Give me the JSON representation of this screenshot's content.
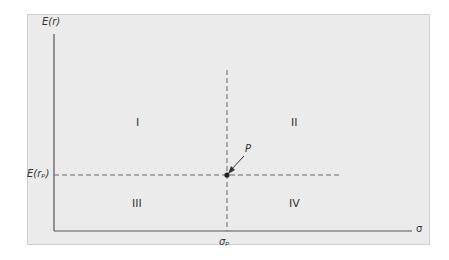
{
  "diagram": {
    "y_axis_label": "E(r)",
    "x_axis_label": "σ",
    "point_label": "P",
    "point_y_label": "E(rₚ)",
    "point_x_label": "σₚ",
    "quadrants": [
      "I",
      "II",
      "III",
      "IV"
    ],
    "colors": {
      "background": "#ebebeb",
      "axis": "#555555",
      "dashed": "#666666",
      "point": "#222222"
    }
  }
}
